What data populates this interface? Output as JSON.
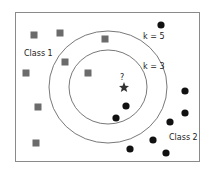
{
  "diagram": {
    "labels": {
      "class1": "Class 1",
      "class2": "Class 2",
      "k_outer": "k = 5",
      "k_inner": "k = 3",
      "query": "?"
    },
    "colors": {
      "border": "#8a8a8a",
      "circle": "#555555",
      "class1_square": "#6b6b6b",
      "class2_dot": "#111111",
      "query_star": "#333333"
    },
    "circles": [
      {
        "name": "k5",
        "cx": 108,
        "cy": 87,
        "rx": 59,
        "ry": 56
      },
      {
        "name": "k3",
        "cx": 108,
        "cy": 87,
        "rx": 39,
        "ry": 37
      }
    ],
    "class1_points": [
      [
        34,
        35
      ],
      [
        60,
        33
      ],
      [
        105,
        39
      ],
      [
        65,
        62
      ],
      [
        26,
        73
      ],
      [
        88,
        73
      ],
      [
        38,
        107
      ],
      [
        36,
        143
      ]
    ],
    "class2_points": [
      [
        161,
        25
      ],
      [
        185,
        91
      ],
      [
        126,
        106
      ],
      [
        185,
        113
      ],
      [
        116,
        118
      ],
      [
        170,
        122
      ],
      [
        153,
        140
      ],
      [
        130,
        149
      ],
      [
        166,
        153
      ]
    ],
    "query_point": [
      124,
      87
    ]
  }
}
